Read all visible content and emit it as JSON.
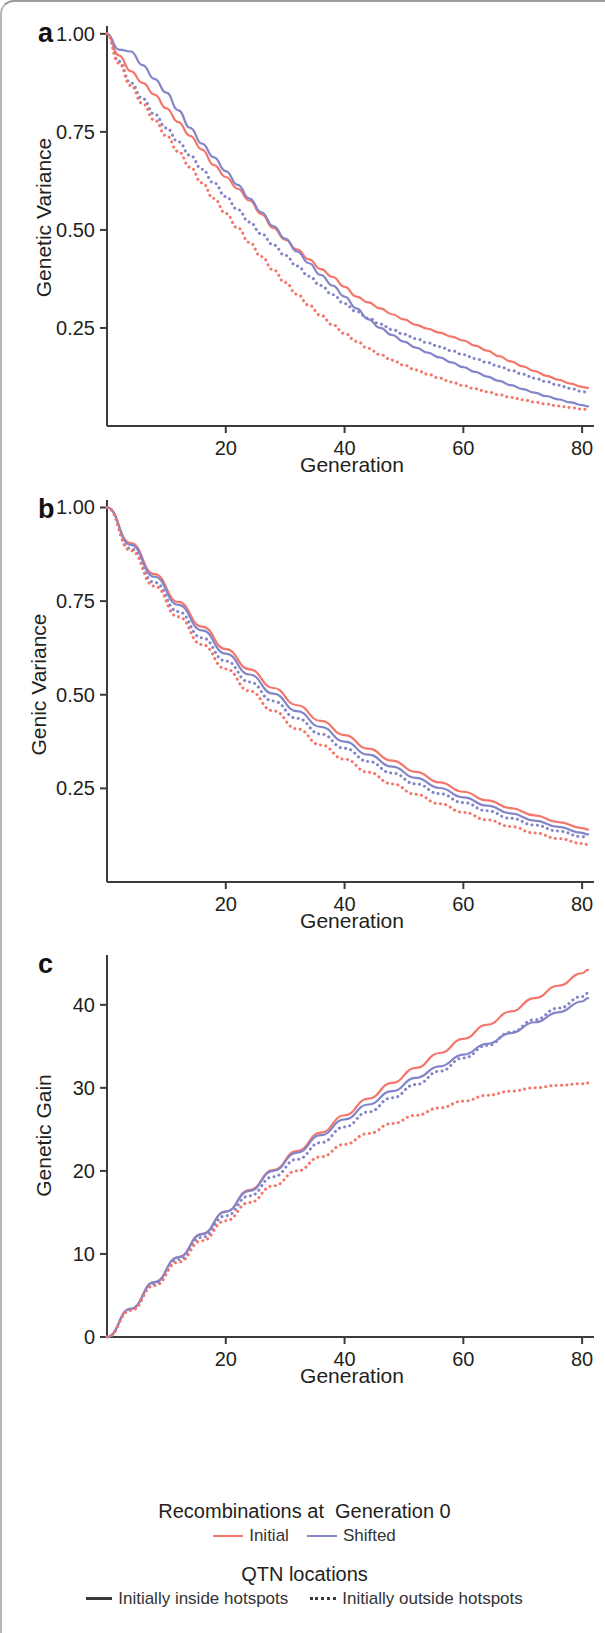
{
  "figure": {
    "panels": [
      {
        "letter": "a",
        "ylabel": "Genetic Variance",
        "xlabel": "Generation",
        "y_ticks": [
          "0.25",
          "0.50",
          "0.75",
          "1.00"
        ],
        "x_ticks": [
          "20",
          "40",
          "60",
          "80"
        ]
      },
      {
        "letter": "b",
        "ylabel": "Genic Variance",
        "xlabel": "Generation",
        "y_ticks": [
          "0.25",
          "0.50",
          "0.75",
          "1.00"
        ],
        "x_ticks": [
          "20",
          "40",
          "60",
          "80"
        ]
      },
      {
        "letter": "c",
        "ylabel": "Genetic Gain",
        "xlabel": "Generation",
        "y_ticks": [
          "0",
          "10",
          "20",
          "30",
          "40"
        ],
        "x_ticks": [
          "20",
          "40",
          "60",
          "80"
        ]
      }
    ]
  },
  "legend": {
    "recombination_title": "Recombinations at  Generation 0",
    "recombination_entries": [
      {
        "label": "Initial",
        "color": "#f4766a",
        "style": "solid"
      },
      {
        "label": "Shifted",
        "color": "#8286c9",
        "style": "solid"
      }
    ],
    "qtn_title": "QTN locations",
    "qtn_entries": [
      {
        "label": "Initially inside hotspots",
        "color": "#3a3a3a",
        "style": "solid"
      },
      {
        "label": "Initially outside hotspots",
        "color": "#3a3a3a",
        "style": "dotted"
      }
    ]
  },
  "colors": {
    "initial": "#f4766a",
    "shifted": "#8286c9",
    "axis": "#3b3b3b",
    "text": "#231f20",
    "frame": "#b0b0b0"
  },
  "chart_data": [
    {
      "type": "line",
      "panel": "a",
      "title": "",
      "xlabel": "Generation",
      "ylabel": "Genetic Variance",
      "xlim": [
        0,
        82
      ],
      "ylim": [
        0,
        1.02
      ],
      "xticks": [
        20,
        40,
        60,
        80
      ],
      "yticks": [
        0.25,
        0.5,
        0.75,
        1.0
      ],
      "grid": false,
      "x": [
        0,
        2,
        4,
        6,
        8,
        10,
        12,
        14,
        16,
        18,
        20,
        22,
        24,
        26,
        28,
        30,
        32,
        34,
        36,
        38,
        40,
        42,
        44,
        46,
        48,
        50,
        52,
        54,
        56,
        58,
        60,
        62,
        64,
        66,
        68,
        70,
        72,
        74,
        76,
        78,
        80,
        81
      ],
      "series": [
        {
          "name": "Initial / Initially inside hotspots",
          "color": "#f4766a",
          "style": "solid",
          "values": [
            1.0,
            0.945,
            0.905,
            0.875,
            0.845,
            0.81,
            0.775,
            0.74,
            0.705,
            0.665,
            0.635,
            0.605,
            0.575,
            0.54,
            0.505,
            0.475,
            0.45,
            0.425,
            0.4,
            0.38,
            0.355,
            0.33,
            0.315,
            0.3,
            0.285,
            0.272,
            0.258,
            0.248,
            0.238,
            0.228,
            0.218,
            0.205,
            0.192,
            0.178,
            0.165,
            0.152,
            0.14,
            0.128,
            0.118,
            0.108,
            0.1,
            0.097
          ]
        },
        {
          "name": "Shifted / Initially inside hotspots",
          "color": "#8286c9",
          "style": "solid",
          "values": [
            1.0,
            0.96,
            0.955,
            0.92,
            0.885,
            0.85,
            0.805,
            0.76,
            0.72,
            0.685,
            0.65,
            0.615,
            0.58,
            0.545,
            0.51,
            0.478,
            0.445,
            0.415,
            0.385,
            0.358,
            0.33,
            0.3,
            0.272,
            0.25,
            0.232,
            0.215,
            0.2,
            0.187,
            0.175,
            0.162,
            0.15,
            0.138,
            0.126,
            0.115,
            0.104,
            0.094,
            0.085,
            0.076,
            0.068,
            0.06,
            0.053,
            0.05
          ]
        },
        {
          "name": "Shifted / Initially outside hotspots",
          "color": "#8286c9",
          "style": "dotted",
          "values": [
            1.0,
            0.93,
            0.875,
            0.835,
            0.795,
            0.76,
            0.725,
            0.69,
            0.655,
            0.62,
            0.585,
            0.552,
            0.52,
            0.49,
            0.462,
            0.435,
            0.408,
            0.382,
            0.358,
            0.335,
            0.312,
            0.292,
            0.275,
            0.26,
            0.246,
            0.234,
            0.223,
            0.212,
            0.202,
            0.192,
            0.182,
            0.172,
            0.162,
            0.152,
            0.142,
            0.132,
            0.122,
            0.113,
            0.104,
            0.096,
            0.088,
            0.085
          ]
        },
        {
          "name": "Initial / Initially outside hotspots",
          "color": "#f4766a",
          "style": "dotted",
          "values": [
            1.0,
            0.925,
            0.868,
            0.822,
            0.78,
            0.74,
            0.7,
            0.66,
            0.62,
            0.58,
            0.542,
            0.505,
            0.468,
            0.432,
            0.398,
            0.366,
            0.336,
            0.308,
            0.282,
            0.258,
            0.236,
            0.216,
            0.198,
            0.182,
            0.168,
            0.155,
            0.143,
            0.132,
            0.122,
            0.112,
            0.103,
            0.095,
            0.087,
            0.08,
            0.073,
            0.067,
            0.061,
            0.056,
            0.051,
            0.047,
            0.043,
            0.042
          ]
        }
      ]
    },
    {
      "type": "line",
      "panel": "b",
      "title": "",
      "xlabel": "Generation",
      "ylabel": "Genic Variance",
      "xlim": [
        0,
        82
      ],
      "ylim": [
        0,
        1.02
      ],
      "xticks": [
        20,
        40,
        60,
        80
      ],
      "yticks": [
        0.25,
        0.5,
        0.75,
        1.0
      ],
      "grid": false,
      "x": [
        0,
        4,
        8,
        12,
        16,
        20,
        24,
        28,
        32,
        36,
        40,
        44,
        48,
        52,
        56,
        60,
        64,
        68,
        72,
        76,
        80,
        81
      ],
      "series": [
        {
          "name": "Initial / Initially inside hotspots",
          "color": "#f4766a",
          "style": "solid",
          "values": [
            1.0,
            0.905,
            0.822,
            0.748,
            0.682,
            0.622,
            0.568,
            0.518,
            0.472,
            0.43,
            0.392,
            0.356,
            0.324,
            0.294,
            0.266,
            0.241,
            0.218,
            0.197,
            0.178,
            0.16,
            0.144,
            0.14
          ]
        },
        {
          "name": "Shifted / Initially inside hotspots",
          "color": "#8286c9",
          "style": "solid",
          "values": [
            1.0,
            0.9,
            0.815,
            0.74,
            0.672,
            0.61,
            0.554,
            0.503,
            0.456,
            0.414,
            0.375,
            0.34,
            0.308,
            0.278,
            0.251,
            0.226,
            0.204,
            0.183,
            0.164,
            0.147,
            0.131,
            0.127
          ]
        },
        {
          "name": "Shifted / Initially outside hotspots",
          "color": "#8286c9",
          "style": "dotted",
          "values": [
            1.0,
            0.89,
            0.8,
            0.722,
            0.652,
            0.59,
            0.534,
            0.483,
            0.437,
            0.395,
            0.357,
            0.322,
            0.291,
            0.262,
            0.236,
            0.212,
            0.19,
            0.17,
            0.152,
            0.136,
            0.121,
            0.117
          ]
        },
        {
          "name": "Initial / Initially outside hotspots",
          "color": "#f4766a",
          "style": "dotted",
          "values": [
            1.0,
            0.885,
            0.79,
            0.708,
            0.634,
            0.569,
            0.51,
            0.457,
            0.409,
            0.366,
            0.328,
            0.293,
            0.262,
            0.234,
            0.209,
            0.186,
            0.166,
            0.148,
            0.131,
            0.116,
            0.103,
            0.1
          ]
        }
      ]
    },
    {
      "type": "line",
      "panel": "c",
      "title": "",
      "xlabel": "Generation",
      "ylabel": "Genetic Gain",
      "xlim": [
        0,
        82
      ],
      "ylim": [
        0,
        46
      ],
      "xticks": [
        20,
        40,
        60,
        80
      ],
      "yticks": [
        0,
        10,
        20,
        30,
        40
      ],
      "grid": false,
      "x": [
        0,
        4,
        8,
        12,
        16,
        20,
        24,
        28,
        32,
        36,
        40,
        44,
        48,
        52,
        56,
        60,
        64,
        68,
        72,
        76,
        80,
        81
      ],
      "series": [
        {
          "name": "Initial / Initially inside hotspots",
          "color": "#f4766a",
          "style": "solid",
          "values": [
            0.0,
            3.4,
            6.6,
            9.6,
            12.4,
            15.1,
            17.7,
            20.1,
            22.4,
            24.6,
            26.7,
            28.7,
            30.6,
            32.4,
            34.2,
            35.9,
            37.6,
            39.2,
            40.8,
            42.3,
            43.8,
            44.2
          ]
        },
        {
          "name": "Shifted / Initially inside hotspots",
          "color": "#8286c9",
          "style": "solid",
          "values": [
            0.0,
            3.4,
            6.6,
            9.6,
            12.4,
            15.1,
            17.6,
            20.0,
            22.2,
            24.3,
            26.2,
            28.0,
            29.6,
            31.2,
            32.6,
            34.0,
            35.3,
            36.6,
            37.9,
            39.1,
            40.4,
            40.8
          ]
        },
        {
          "name": "Shifted / Initially outside hotspots",
          "color": "#8286c9",
          "style": "dotted",
          "values": [
            0.0,
            3.3,
            6.4,
            9.3,
            12.0,
            14.6,
            17.0,
            19.3,
            21.4,
            23.4,
            25.3,
            27.1,
            28.8,
            30.4,
            32.0,
            33.6,
            35.1,
            36.7,
            38.2,
            39.6,
            41.0,
            41.4
          ]
        },
        {
          "name": "Initial / Initially outside hotspots",
          "color": "#f4766a",
          "style": "dotted",
          "values": [
            0.0,
            3.2,
            6.2,
            9.0,
            11.6,
            14.0,
            16.2,
            18.2,
            20.0,
            21.7,
            23.2,
            24.5,
            25.7,
            26.7,
            27.6,
            28.4,
            29.1,
            29.6,
            30.0,
            30.3,
            30.5,
            30.6
          ]
        }
      ]
    }
  ]
}
